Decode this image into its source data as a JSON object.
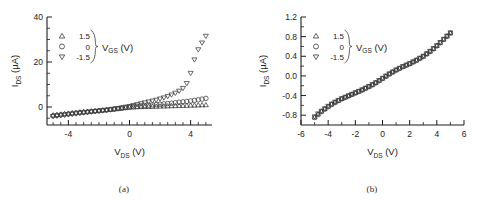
{
  "figure": {
    "panels": [
      {
        "id": "a",
        "caption": "(a)",
        "xlabel_main": "V",
        "xlabel_sub": "DS",
        "xlabel_unit": " (V)",
        "ylabel_main": "I",
        "ylabel_sub": "DS",
        "ylabel_unit": " (µA)",
        "legend_title_main": "V",
        "legend_title_sub": "GS",
        "legend_title_unit": " (V)",
        "legend": [
          {
            "marker": "triangle-up-marker",
            "value": "1.5"
          },
          {
            "marker": "circle-marker",
            "value": "0"
          },
          {
            "marker": "triangle-down-marker",
            "value": "-1.5"
          }
        ],
        "xticks": [
          "-4",
          "0",
          "4"
        ],
        "yticks": [
          "0",
          "20",
          "40"
        ]
      },
      {
        "id": "b",
        "caption": "(b)",
        "xlabel_main": "V",
        "xlabel_sub": "DS",
        "xlabel_unit": " (V)",
        "ylabel_main": "I",
        "ylabel_sub": "DS",
        "ylabel_unit": " (µA)",
        "legend_title_main": "V",
        "legend_title_sub": "GS",
        "legend_title_unit": " (V)",
        "legend": [
          {
            "marker": "triangle-up-marker",
            "value": "1.5"
          },
          {
            "marker": "circle-marker",
            "value": "0"
          },
          {
            "marker": "triangle-down-marker",
            "value": "-1.5"
          }
        ],
        "xticks": [
          "-6",
          "-4",
          "-2",
          "0",
          "2",
          "4",
          "6"
        ],
        "yticks": [
          "-0.8",
          "-0.4",
          "0.0",
          "0.4",
          "0.8",
          "1.2"
        ]
      }
    ]
  },
  "chart_data": [
    {
      "type": "scatter",
      "panel": "a",
      "title": "",
      "xlabel": "V_DS (V)",
      "ylabel": "I_DS (µA)",
      "xlim": [
        -5.4,
        5.4
      ],
      "ylim": [
        -8,
        40
      ],
      "xticks": [
        -4,
        0,
        4
      ],
      "yticks": [
        0,
        20,
        40
      ],
      "grid": false,
      "legend_position": "upper-left",
      "legend_title": "V_GS (V)",
      "x": [
        -5.0,
        -4.75,
        -4.5,
        -4.25,
        -4.0,
        -3.75,
        -3.5,
        -3.25,
        -3.0,
        -2.75,
        -2.5,
        -2.25,
        -2.0,
        -1.75,
        -1.5,
        -1.25,
        -1.0,
        -0.75,
        -0.5,
        -0.25,
        0.0,
        0.25,
        0.5,
        0.75,
        1.0,
        1.25,
        1.5,
        1.75,
        2.0,
        2.25,
        2.5,
        2.75,
        3.0,
        3.25,
        3.5,
        3.75,
        4.0,
        4.25,
        4.5,
        4.75,
        5.0
      ],
      "series": [
        {
          "name": "1.5",
          "marker": "triangle-up",
          "values": [
            -3.6,
            -3.4,
            -3.2,
            -3.0,
            -2.8,
            -2.6,
            -2.4,
            -2.25,
            -2.1,
            -1.95,
            -1.8,
            -1.65,
            -1.5,
            -1.35,
            -1.2,
            -1.05,
            -0.9,
            -0.7,
            -0.5,
            -0.3,
            -0.1,
            0.0,
            0.05,
            0.1,
            0.15,
            0.2,
            0.25,
            0.3,
            0.35,
            0.4,
            0.45,
            0.5,
            0.55,
            0.6,
            0.65,
            0.7,
            0.75,
            0.8,
            0.85,
            0.9,
            0.95
          ]
        },
        {
          "name": "0",
          "marker": "circle",
          "values": [
            -3.9,
            -3.7,
            -3.5,
            -3.3,
            -3.1,
            -2.9,
            -2.7,
            -2.5,
            -2.35,
            -2.2,
            -2.0,
            -1.85,
            -1.7,
            -1.5,
            -1.35,
            -1.15,
            -0.95,
            -0.75,
            -0.55,
            -0.3,
            -0.05,
            0.15,
            0.35,
            0.5,
            0.65,
            0.8,
            0.95,
            1.1,
            1.25,
            1.4,
            1.55,
            1.7,
            1.9,
            2.1,
            2.3,
            2.5,
            2.7,
            2.95,
            3.2,
            3.5,
            3.8
          ]
        },
        {
          "name": "-1.5",
          "marker": "triangle-down",
          "values": [
            -4.2,
            -4.0,
            -3.8,
            -3.6,
            -3.4,
            -3.2,
            -3.0,
            -2.8,
            -2.6,
            -2.4,
            -2.2,
            -2.0,
            -1.8,
            -1.6,
            -1.4,
            -1.15,
            -0.9,
            -0.6,
            -0.3,
            0.0,
            0.3,
            0.7,
            1.1,
            1.5,
            1.9,
            2.3,
            2.7,
            3.1,
            3.6,
            4.1,
            4.7,
            5.4,
            6.2,
            7.1,
            8.3,
            10.5,
            15.0,
            21.0,
            25.5,
            28.5,
            31.5
          ]
        }
      ]
    },
    {
      "type": "scatter",
      "panel": "b",
      "title": "",
      "xlabel": "V_DS (V)",
      "ylabel": "I_DS (µA)",
      "xlim": [
        -6,
        6
      ],
      "ylim": [
        -1.0,
        1.2
      ],
      "xticks": [
        -6,
        -4,
        -2,
        0,
        2,
        4,
        6
      ],
      "yticks": [
        -0.8,
        -0.4,
        0.0,
        0.4,
        0.8,
        1.2
      ],
      "grid": false,
      "legend_position": "upper-left",
      "legend_title": "V_GS (V)",
      "x": [
        -5.0,
        -4.75,
        -4.5,
        -4.25,
        -4.0,
        -3.75,
        -3.5,
        -3.25,
        -3.0,
        -2.75,
        -2.5,
        -2.25,
        -2.0,
        -1.75,
        -1.5,
        -1.25,
        -1.0,
        -0.75,
        -0.5,
        -0.25,
        0.0,
        0.25,
        0.5,
        0.75,
        1.0,
        1.25,
        1.5,
        1.75,
        2.0,
        2.25,
        2.5,
        2.75,
        3.0,
        3.25,
        3.5,
        3.75,
        4.0,
        4.25,
        4.5,
        4.75,
        5.0
      ],
      "series": [
        {
          "name": "1.5",
          "marker": "triangle-up",
          "values": [
            -0.84,
            -0.78,
            -0.72,
            -0.67,
            -0.62,
            -0.575,
            -0.535,
            -0.5,
            -0.465,
            -0.435,
            -0.405,
            -0.375,
            -0.345,
            -0.315,
            -0.285,
            -0.25,
            -0.215,
            -0.18,
            -0.14,
            -0.095,
            -0.05,
            -0.005,
            0.04,
            0.08,
            0.12,
            0.155,
            0.19,
            0.22,
            0.25,
            0.285,
            0.32,
            0.36,
            0.4,
            0.45,
            0.5,
            0.555,
            0.615,
            0.68,
            0.745,
            0.81,
            0.875
          ]
        },
        {
          "name": "0",
          "marker": "circle",
          "values": [
            -0.85,
            -0.79,
            -0.73,
            -0.68,
            -0.63,
            -0.585,
            -0.545,
            -0.505,
            -0.47,
            -0.44,
            -0.41,
            -0.38,
            -0.35,
            -0.32,
            -0.29,
            -0.255,
            -0.22,
            -0.185,
            -0.145,
            -0.1,
            -0.055,
            -0.01,
            0.035,
            0.075,
            0.115,
            0.15,
            0.185,
            0.215,
            0.245,
            0.28,
            0.315,
            0.355,
            0.395,
            0.445,
            0.495,
            0.55,
            0.61,
            0.675,
            0.74,
            0.805,
            0.87
          ]
        },
        {
          "name": "-1.5",
          "marker": "triangle-down",
          "values": [
            -0.83,
            -0.77,
            -0.715,
            -0.665,
            -0.615,
            -0.57,
            -0.53,
            -0.495,
            -0.46,
            -0.43,
            -0.4,
            -0.37,
            -0.34,
            -0.31,
            -0.28,
            -0.245,
            -0.21,
            -0.175,
            -0.135,
            -0.09,
            -0.045,
            0.0,
            0.045,
            0.085,
            0.125,
            0.16,
            0.195,
            0.225,
            0.255,
            0.29,
            0.325,
            0.365,
            0.405,
            0.455,
            0.505,
            0.56,
            0.62,
            0.685,
            0.75,
            0.815,
            0.88
          ]
        }
      ]
    }
  ]
}
